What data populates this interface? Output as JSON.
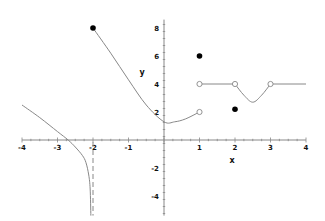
{
  "chart_data": {
    "type": "line",
    "title": "",
    "xlabel": "x",
    "ylabel": "y",
    "xlim": [
      -4,
      4
    ],
    "ylim": [
      -5,
      8.5
    ],
    "grid": false,
    "legend": null,
    "x_ticks": [
      "-4",
      "-3",
      "-2",
      "-1",
      "1",
      "2",
      "3",
      "4"
    ],
    "y_ticks": [
      "8",
      "6",
      "4",
      "2",
      "-2",
      "-4"
    ],
    "series": [
      {
        "name": "left-branch",
        "description": "Decreasing curve approaching vertical asymptote x=-2 from the left, going to -infinity",
        "points": [
          [
            -4,
            2.5
          ],
          [
            -3.5,
            1.6
          ],
          [
            -3,
            0.6
          ],
          [
            -2.7,
            0
          ],
          [
            -2.5,
            -0.5
          ],
          [
            -2.3,
            -1.1
          ],
          [
            -2.2,
            -1.6
          ],
          [
            -2.12,
            -2.5
          ],
          [
            -2.08,
            -3.5
          ],
          [
            -2.06,
            -5.4
          ]
        ]
      },
      {
        "name": "middle-branch",
        "description": "Curve from closed point (-2,8) decreasing to min near (0,1), rising to open point (1,2)",
        "points": [
          [
            -2,
            8
          ],
          [
            -1.5,
            6.2
          ],
          [
            -1,
            4.3
          ],
          [
            -0.5,
            2.5
          ],
          [
            0,
            1.3
          ],
          [
            0.3,
            1.3
          ],
          [
            0.6,
            1.5
          ],
          [
            1,
            2
          ]
        ]
      },
      {
        "name": "right-segment-1",
        "description": "Horizontal line y=4 from open (1,4) to open (2,4)",
        "points": [
          [
            1,
            4
          ],
          [
            2,
            4
          ]
        ]
      },
      {
        "name": "right-dip",
        "description": "Dip between open (2,4) and open (3,4), minimum ~2.7 at x=2.5",
        "points": [
          [
            2,
            4
          ],
          [
            2.25,
            3.2
          ],
          [
            2.5,
            2.7
          ],
          [
            2.75,
            3.2
          ],
          [
            3,
            4
          ]
        ]
      },
      {
        "name": "right-segment-2",
        "description": "Horizontal line y=4 from open (3,4) to x=4",
        "points": [
          [
            3,
            4
          ],
          [
            4,
            4
          ]
        ]
      }
    ],
    "asymptotes": [
      {
        "type": "vertical",
        "x": -2,
        "style": "dashed"
      }
    ],
    "closed_points": [
      [
        -2,
        8
      ],
      [
        1,
        6
      ],
      [
        2,
        2.2
      ]
    ],
    "open_points": [
      [
        1,
        2
      ],
      [
        1,
        4
      ],
      [
        2,
        4
      ],
      [
        3,
        4
      ]
    ]
  },
  "style": {
    "curve_color": "#888888",
    "axis_color": "#888888",
    "point_color": "#000000"
  }
}
